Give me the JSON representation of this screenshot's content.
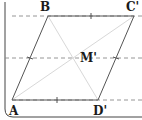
{
  "diagram": {
    "points": {
      "A": {
        "label": "A",
        "x": 12,
        "y": 100
      },
      "B": {
        "label": "B",
        "x": 48,
        "y": 16
      },
      "C": {
        "label": "C'",
        "x": 134,
        "y": 16
      },
      "D": {
        "label": "D'",
        "x": 98,
        "y": 100
      },
      "M": {
        "label": "M'",
        "x": 73,
        "y": 58
      }
    },
    "dashed_lines_y": [
      16,
      58,
      100
    ],
    "colors": {
      "stroke": "#555555",
      "diagonal": "#d8d8d8",
      "dashed": "#8a8a8a",
      "border": "#444444",
      "text": "#1a1a1a"
    }
  }
}
